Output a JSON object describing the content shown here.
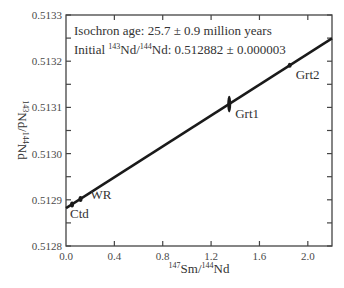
{
  "chart_data": {
    "type": "scatter",
    "title": "",
    "annotations": [
      "Isochron age: 25.7 ± 0.9 million years",
      "Initial 143Nd/144Nd: 0.512882 ± 0.000003"
    ],
    "annotation_parts": {
      "age_text": "Isochron age: 25.7 ± 0.9 million years",
      "initial_prefix": "Initial ",
      "initial_sup1": "143",
      "initial_mid": "Nd/",
      "initial_sup2": "144",
      "initial_suffix": "Nd: 0.512882 ± 0.000003"
    },
    "xlabel": "147Sm/144Nd",
    "xlabel_parts": {
      "sup1": "147",
      "mid": "Sm/",
      "sup2": "144",
      "end": "Nd"
    },
    "ylabel": "143Nd/144Nd",
    "ylabel_parts": {
      "sup1": "143",
      "mid": "Nd/",
      "sup2": "144",
      "end": "Nd"
    },
    "xlim": [
      0.0,
      2.2
    ],
    "ylim": [
      0.5128,
      0.5133
    ],
    "x_ticks": [
      "0.0",
      "0.4",
      "0.8",
      "1.2",
      "1.6",
      "2.0"
    ],
    "x_tick_values": [
      0.0,
      0.4,
      0.8,
      1.2,
      1.6,
      2.0
    ],
    "y_ticks": [
      "0.5128",
      "0.5129",
      "0.5130",
      "0.5131",
      "0.5132",
      "0.5133"
    ],
    "y_tick_values": [
      0.5128,
      0.5129,
      0.513,
      0.5131,
      0.5132,
      0.5133
    ],
    "grid": false,
    "legend": null,
    "isochron_line": {
      "intercept": 0.512882,
      "slope": 0.000167,
      "age_Ma": 25.7,
      "age_err_Ma": 0.9,
      "initial_err": 3e-06
    },
    "points": [
      {
        "label": "Ctd",
        "x": 0.05,
        "y": 0.51289,
        "label_dx": -2,
        "label_dy": 14
      },
      {
        "label": "WR",
        "x": 0.12,
        "y": 0.512902,
        "label_dx": 10,
        "label_dy": 0
      },
      {
        "label": "Grt1",
        "x": 1.35,
        "y": 0.513107,
        "label_dx": 6,
        "label_dy": 14,
        "yerr": 1.8e-05
      },
      {
        "label": "Grt2",
        "x": 1.85,
        "y": 0.513191,
        "label_dx": 6,
        "label_dy": 14,
        "yerr": 5e-06
      }
    ]
  }
}
